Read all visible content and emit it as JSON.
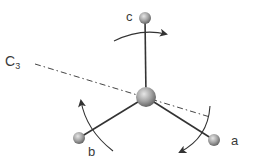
{
  "diagram": {
    "axis_label": {
      "main": "C",
      "sub": "3"
    },
    "atoms": [
      {
        "id": "center",
        "label": "",
        "x": 146,
        "y": 97,
        "r": 10
      },
      {
        "id": "a",
        "label": "a",
        "x": 214,
        "y": 140,
        "r": 6
      },
      {
        "id": "b",
        "label": "b",
        "x": 79,
        "y": 138,
        "r": 6
      },
      {
        "id": "c",
        "label": "c",
        "x": 145,
        "y": 18,
        "r": 6
      }
    ],
    "colors": {
      "bond": "#333333",
      "atom_light": "#d8d8d8",
      "atom_dark": "#6e6e6e",
      "axis_line": "#444444",
      "arrow": "#333333",
      "text": "#3a3a3a"
    }
  }
}
